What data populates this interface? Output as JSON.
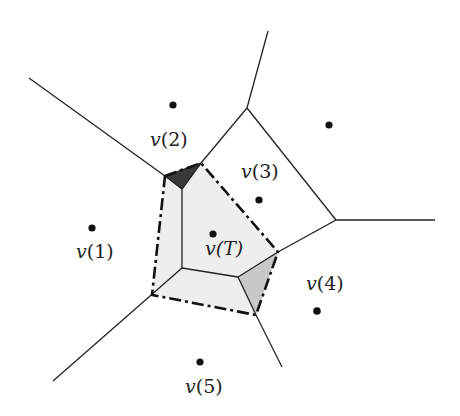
{
  "diagram": {
    "type": "voronoi-diagram",
    "colors": {
      "edge": "#222222",
      "site": "#111111",
      "cell_fill": "#eeeeee",
      "dark_triangle": "#3a3a3a",
      "grey_triangle": "#c8c8c8",
      "dash_boundary": "#111111"
    },
    "labels": {
      "v1": {
        "prefix": "v",
        "index": "(1)"
      },
      "v2": {
        "prefix": "v",
        "index": "(2)"
      },
      "v3": {
        "prefix": "v",
        "index": "(3)"
      },
      "v4": {
        "prefix": "v",
        "index": "(4)"
      },
      "v5": {
        "prefix": "v",
        "index": "(5)"
      },
      "vT": {
        "prefix": "v",
        "index": "(T)"
      }
    },
    "sites": [
      {
        "id": "v1",
        "x": 92,
        "y": 228
      },
      {
        "id": "v2",
        "x": 173,
        "y": 105
      },
      {
        "id": "v3",
        "x": 329,
        "y": 125
      },
      {
        "id": "v4",
        "x": 317,
        "y": 311
      },
      {
        "id": "v5",
        "x": 200,
        "y": 362
      },
      {
        "id": "vT",
        "x": 213,
        "y": 234
      },
      {
        "id": "v3-inner",
        "x": 259,
        "y": 200
      }
    ]
  }
}
